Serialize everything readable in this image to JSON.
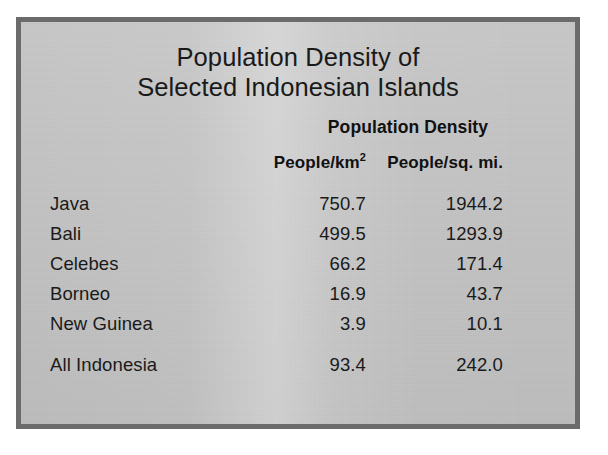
{
  "figure": {
    "title_line1": "Population Density of",
    "title_line2": "Selected Indonesian Islands",
    "group_header": "Population Density",
    "unit_km": "People/km",
    "unit_km_sup": "2",
    "unit_mi": "People/sq. mi.",
    "frame_color": "#6b6b6b",
    "paper_color": "#c3c3c3",
    "text_color": "#1a1a1a"
  },
  "chart_data": {
    "type": "table",
    "title": "Population Density of Selected Indonesian Islands",
    "columns": [
      "",
      "People/km²",
      "People/sq. mi."
    ],
    "column_group": "Population Density",
    "categories": [
      "Java",
      "Bali",
      "Celebes",
      "Borneo",
      "New Guinea",
      "All Indonesia"
    ],
    "series": [
      {
        "name": "People/km²",
        "values": [
          750.7,
          499.5,
          66.2,
          16.9,
          3.9,
          93.4
        ]
      },
      {
        "name": "People/sq. mi.",
        "values": [
          1944.2,
          1293.9,
          171.4,
          43.7,
          10.1,
          242.0
        ]
      }
    ],
    "rows": [
      {
        "name": "Java",
        "km2": "750.7",
        "sqmi": "1944.2",
        "total": false
      },
      {
        "name": "Bali",
        "km2": "499.5",
        "sqmi": "1293.9",
        "total": false
      },
      {
        "name": "Celebes",
        "km2": "66.2",
        "sqmi": "171.4",
        "total": false
      },
      {
        "name": "Borneo",
        "km2": "16.9",
        "sqmi": "43.7",
        "total": false
      },
      {
        "name": "New Guinea",
        "km2": "3.9",
        "sqmi": "10.1",
        "total": false
      },
      {
        "name": "All Indonesia",
        "km2": "93.4",
        "sqmi": "242.0",
        "total": true
      }
    ],
    "grid": false,
    "legend": "none"
  }
}
